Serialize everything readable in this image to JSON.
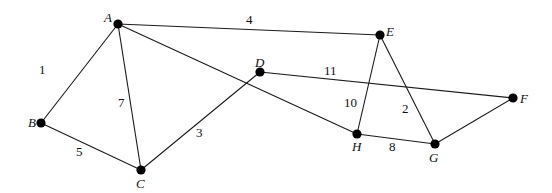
{
  "graph": {
    "type": "undirected-weighted-graph",
    "nodes": [
      {
        "id": "A",
        "label": "A",
        "x": 118,
        "y": 24,
        "lx": 104,
        "ly": 22
      },
      {
        "id": "B",
        "label": "B",
        "x": 41,
        "y": 123,
        "lx": 28,
        "ly": 127
      },
      {
        "id": "C",
        "label": "C",
        "x": 141,
        "y": 170,
        "lx": 136,
        "ly": 188
      },
      {
        "id": "D",
        "label": "D",
        "x": 260,
        "y": 72,
        "lx": 255,
        "ly": 67
      },
      {
        "id": "E",
        "label": "E",
        "x": 380,
        "y": 35,
        "lx": 386,
        "ly": 36
      },
      {
        "id": "F",
        "label": "F",
        "x": 513,
        "y": 98,
        "lx": 520,
        "ly": 103
      },
      {
        "id": "G",
        "label": "G",
        "x": 435,
        "y": 144,
        "lx": 429,
        "ly": 162
      },
      {
        "id": "H",
        "label": "H",
        "x": 357,
        "y": 134,
        "lx": 352,
        "ly": 151
      }
    ],
    "edges": [
      {
        "from": "A",
        "to": "B",
        "weight": "1",
        "wx": 39,
        "wy": 74
      },
      {
        "from": "A",
        "to": "C",
        "weight": "7",
        "wx": 118,
        "wy": 107
      },
      {
        "from": "A",
        "to": "E",
        "weight": "4",
        "wx": 246,
        "wy": 24
      },
      {
        "from": "A",
        "to": "H",
        "weight": "",
        "wx": 0,
        "wy": 0
      },
      {
        "from": "B",
        "to": "C",
        "weight": "5",
        "wx": 76,
        "wy": 156
      },
      {
        "from": "C",
        "to": "D",
        "weight": "3",
        "wx": 196,
        "wy": 137
      },
      {
        "from": "D",
        "to": "F",
        "weight": "11",
        "wx": 324,
        "wy": 75
      },
      {
        "from": "E",
        "to": "H",
        "weight": "10",
        "wx": 344,
        "wy": 107
      },
      {
        "from": "E",
        "to": "G",
        "weight": "2",
        "wx": 402,
        "wy": 113
      },
      {
        "from": "H",
        "to": "G",
        "weight": "8",
        "wx": 389,
        "wy": 151
      },
      {
        "from": "G",
        "to": "F",
        "weight": "",
        "wx": 0,
        "wy": 0
      }
    ]
  }
}
